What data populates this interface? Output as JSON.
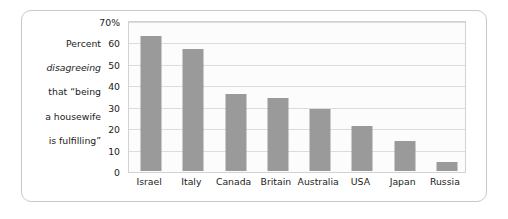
{
  "caption": {
    "line1": "Percent",
    "line2": "disagreeing",
    "line3": "that “being",
    "line4": "a housewife",
    "line5": "is fulfilling”"
  },
  "colors": {
    "bar": "#9a9a9a",
    "frame": "#c9c9c9",
    "gridline": "#dcdcdc",
    "plot_background": "#fcfcfc",
    "text": "#1c1c1c"
  },
  "chart_data": {
    "type": "bar",
    "title": "",
    "subtitle": "",
    "xlabel": "",
    "ylabel": "Percent disagreeing that “being a housewife is fulfilling”",
    "categories": [
      "Israel",
      "Italy",
      "Canada",
      "Britain",
      "Australia",
      "USA",
      "Japan",
      "Russia"
    ],
    "values": [
      63,
      57,
      36,
      34,
      29,
      21,
      14,
      4
    ],
    "ylim": [
      0,
      70
    ],
    "ytick_values": [
      0,
      10,
      20,
      30,
      40,
      50,
      60,
      70
    ],
    "ytick_labels": [
      "0",
      "10",
      "20",
      "30",
      "40",
      "50",
      "60",
      "70%"
    ],
    "grid": true,
    "legend": "none",
    "orientation": "vertical"
  }
}
